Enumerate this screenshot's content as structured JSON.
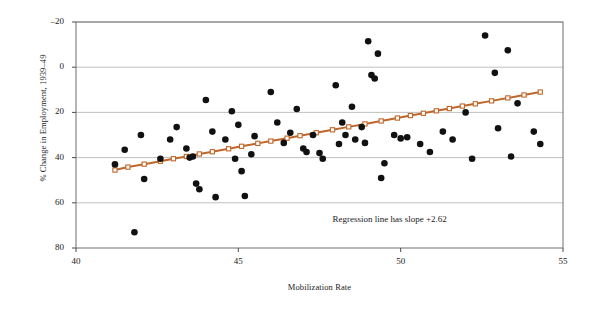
{
  "chart_data": {
    "type": "scatter",
    "title": "",
    "xlabel": "Mobilization Rate",
    "ylabel": "% Change in Employment, 1939–49",
    "xlim": [
      40,
      55
    ],
    "ylim": [
      -20,
      80
    ],
    "xticks": [
      40,
      45,
      50,
      55
    ],
    "yticks": [
      -20,
      0,
      20,
      40,
      60,
      80
    ],
    "grid": "horizontal",
    "legend": "none",
    "annotations": [
      {
        "text": "Regression line has slope +2.62",
        "x": 50.3,
        "y": -7.5
      }
    ],
    "series": [
      {
        "name": "states",
        "type": "scatter",
        "marker": "filled-circle",
        "color": "#111111",
        "points": [
          [
            41.2,
            17.0
          ],
          [
            41.5,
            23.5
          ],
          [
            41.8,
            -13.0
          ],
          [
            42.0,
            30.0
          ],
          [
            42.1,
            10.5
          ],
          [
            42.6,
            19.5
          ],
          [
            42.9,
            28.0
          ],
          [
            43.1,
            33.5
          ],
          [
            43.4,
            24.0
          ],
          [
            43.5,
            20.0
          ],
          [
            43.6,
            20.5
          ],
          [
            43.7,
            8.5
          ],
          [
            43.8,
            6.0
          ],
          [
            44.0,
            45.5
          ],
          [
            44.2,
            31.5
          ],
          [
            44.3,
            2.5
          ],
          [
            44.6,
            28.0
          ],
          [
            44.8,
            40.5
          ],
          [
            44.9,
            19.5
          ],
          [
            45.0,
            34.5
          ],
          [
            45.1,
            14.0
          ],
          [
            45.2,
            3.0
          ],
          [
            45.4,
            21.5
          ],
          [
            45.5,
            29.5
          ],
          [
            46.0,
            49.0
          ],
          [
            46.2,
            35.5
          ],
          [
            46.4,
            26.5
          ],
          [
            46.6,
            31.0
          ],
          [
            46.8,
            41.5
          ],
          [
            47.0,
            24.0
          ],
          [
            47.1,
            22.5
          ],
          [
            47.3,
            30.0
          ],
          [
            47.5,
            22.0
          ],
          [
            47.6,
            19.5
          ],
          [
            48.0,
            52.0
          ],
          [
            48.1,
            26.0
          ],
          [
            48.2,
            35.5
          ],
          [
            48.3,
            30.0
          ],
          [
            48.5,
            42.5
          ],
          [
            48.6,
            28.0
          ],
          [
            48.8,
            33.5
          ],
          [
            48.9,
            26.5
          ],
          [
            49.0,
            71.5
          ],
          [
            49.1,
            56.5
          ],
          [
            49.2,
            55.0
          ],
          [
            49.3,
            66.0
          ],
          [
            49.4,
            11.0
          ],
          [
            49.5,
            17.5
          ],
          [
            49.8,
            30.0
          ],
          [
            50.0,
            28.5
          ],
          [
            50.2,
            29.0
          ],
          [
            50.6,
            26.0
          ],
          [
            50.9,
            22.5
          ],
          [
            51.3,
            31.5
          ],
          [
            51.6,
            28.0
          ],
          [
            52.0,
            40.0
          ],
          [
            52.2,
            19.5
          ],
          [
            52.6,
            74.0
          ],
          [
            52.9,
            57.5
          ],
          [
            53.0,
            33.0
          ],
          [
            53.3,
            67.5
          ],
          [
            53.4,
            20.5
          ],
          [
            53.6,
            44.0
          ],
          [
            54.1,
            31.5
          ],
          [
            54.3,
            26.0
          ]
        ]
      },
      {
        "name": "regression-line",
        "type": "line",
        "marker": "open-square",
        "color": "#c0662a",
        "slope": 2.62,
        "points": [
          [
            41.2,
            14.5
          ],
          [
            41.6,
            15.8
          ],
          [
            42.1,
            17.1
          ],
          [
            42.6,
            18.4
          ],
          [
            43.0,
            19.5
          ],
          [
            43.4,
            20.5
          ],
          [
            43.8,
            21.6
          ],
          [
            44.2,
            22.6
          ],
          [
            44.7,
            23.9
          ],
          [
            45.1,
            25.0
          ],
          [
            45.6,
            26.3
          ],
          [
            46.0,
            27.3
          ],
          [
            46.5,
            28.6
          ],
          [
            46.9,
            29.7
          ],
          [
            47.4,
            31.0
          ],
          [
            47.9,
            32.3
          ],
          [
            48.4,
            33.6
          ],
          [
            48.9,
            34.9
          ],
          [
            49.4,
            36.2
          ],
          [
            49.9,
            37.5
          ],
          [
            50.3,
            38.6
          ],
          [
            50.7,
            39.6
          ],
          [
            51.1,
            40.7
          ],
          [
            51.5,
            41.7
          ],
          [
            51.9,
            42.8
          ],
          [
            52.3,
            43.8
          ],
          [
            52.8,
            45.1
          ],
          [
            53.3,
            46.4
          ],
          [
            53.8,
            47.7
          ],
          [
            54.3,
            49.0
          ]
        ]
      }
    ]
  },
  "axis": {
    "y_title": "% Change in Employment, 1939–49",
    "x_title": "Mobilization Rate",
    "y_tick_labels": [
      "80",
      "60",
      "40",
      "20",
      "0",
      "–20"
    ],
    "x_tick_labels": [
      "40",
      "45",
      "50",
      "55"
    ]
  },
  "note": {
    "regression_text": "Regression line has slope +2.62"
  },
  "colors": {
    "point": "#111111",
    "regression": "#c0662a",
    "grid": "#b0b0b0",
    "frame": "#7a7a7a",
    "background": "#ffffff"
  }
}
